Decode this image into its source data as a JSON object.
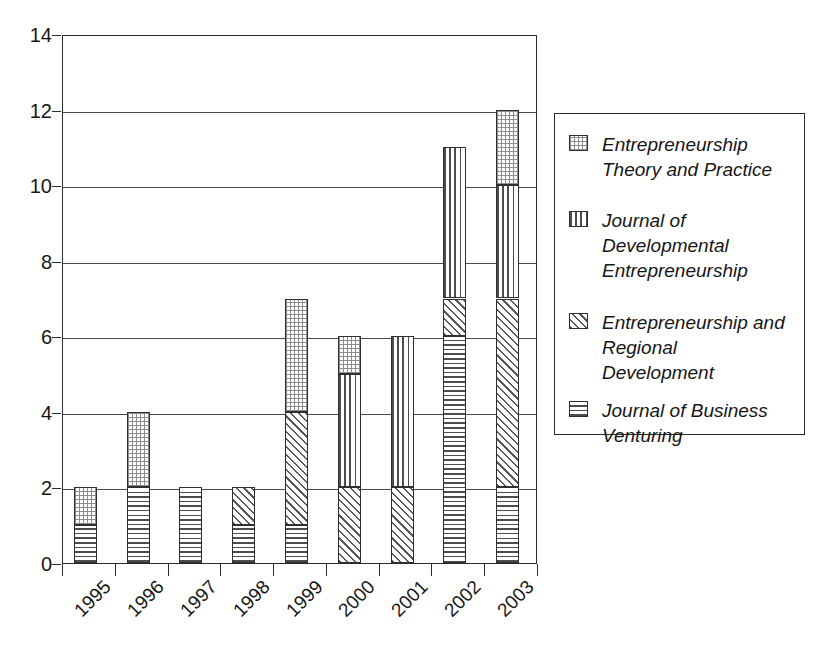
{
  "chart_data": {
    "type": "bar",
    "subtype": "stacked-vertical",
    "title": "",
    "xlabel": "",
    "ylabel": "",
    "categories": [
      "1995",
      "1996",
      "1997",
      "1998",
      "1999",
      "2000",
      "2001",
      "2002",
      "2003"
    ],
    "ylim": [
      0,
      14
    ],
    "y_ticks": [
      0,
      2,
      4,
      6,
      8,
      10,
      12,
      14
    ],
    "grid": true,
    "legend_position": "right",
    "series": [
      {
        "name": "Entrepreneurship Theory and Practice",
        "label_lines": "Entrepreneurship\nTheory and Practice",
        "pattern": "dots",
        "values": [
          1,
          2,
          0,
          0,
          3,
          1,
          0,
          0,
          2
        ]
      },
      {
        "name": "Journal of Developmental Entrepreneurship",
        "label_lines": "Journal of\nDevelopmental\nEntrepreneurship",
        "pattern": "vertical",
        "values": [
          0,
          0,
          0,
          0,
          0,
          3,
          4,
          4,
          3
        ]
      },
      {
        "name": "Entrepreneurship and Regional Development",
        "label_lines": "Entrepreneurship and\nRegional\nDevelopment",
        "pattern": "diagonal",
        "values": [
          0,
          0,
          0,
          1,
          3,
          2,
          2,
          1,
          5
        ]
      },
      {
        "name": "Journal of Business Venturing",
        "label_lines": "Journal of Business\nVenturing",
        "pattern": "horizontal",
        "values": [
          1,
          2,
          2,
          1,
          1,
          0,
          0,
          6,
          2
        ]
      }
    ],
    "totals": [
      2,
      4,
      2,
      2,
      7,
      6,
      6,
      11,
      12
    ],
    "stacks": [
      {
        "category": "1995",
        "segments": [
          {
            "pattern": "horizontal",
            "from": 0,
            "to": 1
          },
          {
            "pattern": "dots",
            "from": 1,
            "to": 2
          }
        ]
      },
      {
        "category": "1996",
        "segments": [
          {
            "pattern": "horizontal",
            "from": 0,
            "to": 2
          },
          {
            "pattern": "dots",
            "from": 2,
            "to": 4
          }
        ]
      },
      {
        "category": "1997",
        "segments": [
          {
            "pattern": "horizontal",
            "from": 0,
            "to": 2
          }
        ]
      },
      {
        "category": "1998",
        "segments": [
          {
            "pattern": "horizontal",
            "from": 0,
            "to": 1
          },
          {
            "pattern": "diagonal",
            "from": 1,
            "to": 2
          }
        ]
      },
      {
        "category": "1999",
        "segments": [
          {
            "pattern": "horizontal",
            "from": 0,
            "to": 1
          },
          {
            "pattern": "diagonal",
            "from": 1,
            "to": 4
          },
          {
            "pattern": "dots",
            "from": 4,
            "to": 7
          }
        ]
      },
      {
        "category": "2000",
        "segments": [
          {
            "pattern": "diagonal",
            "from": 0,
            "to": 2
          },
          {
            "pattern": "vertical",
            "from": 2,
            "to": 5
          },
          {
            "pattern": "dots",
            "from": 5,
            "to": 6
          }
        ]
      },
      {
        "category": "2001",
        "segments": [
          {
            "pattern": "diagonal",
            "from": 0,
            "to": 2
          },
          {
            "pattern": "vertical",
            "from": 2,
            "to": 6
          }
        ]
      },
      {
        "category": "2002",
        "segments": [
          {
            "pattern": "horizontal",
            "from": 0,
            "to": 6
          },
          {
            "pattern": "diagonal",
            "from": 6,
            "to": 7
          },
          {
            "pattern": "vertical",
            "from": 7,
            "to": 11
          }
        ]
      },
      {
        "category": "2003",
        "segments": [
          {
            "pattern": "horizontal",
            "from": 0,
            "to": 2
          },
          {
            "pattern": "diagonal",
            "from": 2,
            "to": 7
          },
          {
            "pattern": "vertical",
            "from": 7,
            "to": 10
          },
          {
            "pattern": "dots",
            "from": 10,
            "to": 12
          }
        ]
      }
    ],
    "colors": {
      "axis": "#2b2b2b",
      "grid": "#4a4a4a",
      "text": "#161616",
      "pattern_ink": "#4d4d4d",
      "background": "#ffffff"
    }
  }
}
